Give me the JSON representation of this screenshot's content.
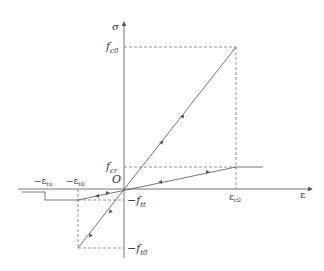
{
  "diagram": {
    "type": "stress-strain",
    "axes": {
      "x_label": "ε",
      "y_label": "σ",
      "origin_label": "O"
    },
    "labels": {
      "fc0": {
        "base": "f",
        "sub": "c0"
      },
      "fcr": {
        "base": "f",
        "sub": "cr"
      },
      "neg_ft": {
        "prefix": "−",
        "base": "f",
        "sub": "tt"
      },
      "neg_ft0": {
        "prefix": "−",
        "base": "f",
        "sub": "t0"
      },
      "ec0": {
        "base": "ε",
        "sub": "c0"
      },
      "neg_et0": {
        "prefix": "−",
        "base": "ε",
        "sub": "t0"
      },
      "neg_etu": {
        "prefix": "−",
        "base": "ε",
        "sub": "tu"
      }
    },
    "colors": {
      "line": "#555555",
      "dashed": "#666666",
      "text": "#333333"
    }
  }
}
